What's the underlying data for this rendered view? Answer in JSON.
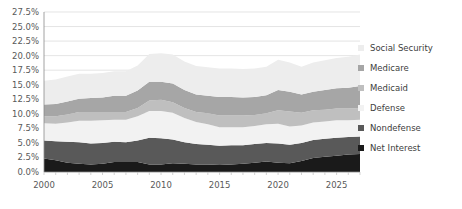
{
  "chart_data": {
    "type": "area",
    "stacked": true,
    "title": "",
    "subtitle": "",
    "xlabel": "",
    "ylabel": "",
    "grid": true,
    "legend_position": "right",
    "xlim": [
      2000,
      2027
    ],
    "ylim": [
      0,
      27.5
    ],
    "y_tick_labels": [
      "0.0%",
      "2.5%",
      "5.0%",
      "7.5%",
      "10.0%",
      "12.5%",
      "15.0%",
      "17.5%",
      "20.0%",
      "22.5%",
      "25.0%",
      "27.5%"
    ],
    "y_tick_values": [
      0,
      2.5,
      5,
      7.5,
      10,
      12.5,
      15,
      17.5,
      20,
      22.5,
      25,
      27.5
    ],
    "x_tick_labels": [
      "2000",
      "2005",
      "2010",
      "2015",
      "2020",
      "2025"
    ],
    "x_tick_values": [
      2000,
      2005,
      2010,
      2015,
      2020,
      2025
    ],
    "x": [
      2000,
      2001,
      2002,
      2003,
      2004,
      2005,
      2006,
      2007,
      2008,
      2009,
      2010,
      2011,
      2012,
      2013,
      2014,
      2015,
      2016,
      2017,
      2018,
      2019,
      2020,
      2021,
      2022,
      2023,
      2024,
      2025,
      2026,
      2027
    ],
    "stack_order_bottom_to_top": [
      "Net Interest",
      "Nondefense",
      "Defense",
      "Medicaid",
      "Medicare",
      "Social Security"
    ],
    "series": [
      {
        "name": "Net Interest",
        "color": "#1a1a1a",
        "values": [
          2.3,
          2.0,
          1.6,
          1.4,
          1.3,
          1.4,
          1.7,
          1.7,
          1.7,
          1.3,
          1.3,
          1.5,
          1.4,
          1.3,
          1.3,
          1.2,
          1.3,
          1.4,
          1.6,
          1.8,
          1.6,
          1.5,
          1.9,
          2.4,
          2.6,
          2.8,
          3.0,
          3.1
        ]
      },
      {
        "name": "Nondefense",
        "color": "#595959",
        "values": [
          3.1,
          3.3,
          3.6,
          3.7,
          3.6,
          3.6,
          3.5,
          3.4,
          3.7,
          4.6,
          4.5,
          4.1,
          3.7,
          3.5,
          3.4,
          3.3,
          3.3,
          3.2,
          3.2,
          3.2,
          3.3,
          3.2,
          3.1,
          3.1,
          3.1,
          3.1,
          3.0,
          3.0
        ]
      },
      {
        "name": "Defense",
        "color": "#f2f2f2",
        "values": [
          3.0,
          3.0,
          3.3,
          3.7,
          3.9,
          3.9,
          3.8,
          3.9,
          4.2,
          4.6,
          4.7,
          4.6,
          4.2,
          3.8,
          3.5,
          3.2,
          3.1,
          3.1,
          3.1,
          3.2,
          3.4,
          3.1,
          3.0,
          3.0,
          3.0,
          3.0,
          2.9,
          2.9
        ]
      },
      {
        "name": "Medicaid",
        "color": "#bfbfbf",
        "values": [
          1.2,
          1.3,
          1.4,
          1.5,
          1.5,
          1.4,
          1.3,
          1.3,
          1.4,
          1.8,
          1.9,
          1.8,
          1.7,
          1.7,
          1.9,
          2.0,
          2.0,
          2.0,
          1.9,
          1.9,
          2.3,
          2.6,
          2.2,
          2.1,
          2.0,
          2.0,
          2.0,
          2.0
        ]
      },
      {
        "name": "Medicare",
        "color": "#a6a6a6",
        "values": [
          2.0,
          2.1,
          2.2,
          2.3,
          2.4,
          2.5,
          2.8,
          2.8,
          3.0,
          3.2,
          3.1,
          3.2,
          3.1,
          3.0,
          3.0,
          3.2,
          3.2,
          3.1,
          3.1,
          3.1,
          3.5,
          3.4,
          3.1,
          3.2,
          3.4,
          3.5,
          3.6,
          3.8
        ]
      },
      {
        "name": "Social Security",
        "color": "#ededed",
        "values": [
          4.1,
          4.2,
          4.3,
          4.3,
          4.2,
          4.2,
          4.2,
          4.2,
          4.3,
          4.8,
          4.9,
          5.0,
          4.9,
          4.9,
          4.9,
          4.9,
          4.9,
          4.9,
          4.9,
          4.9,
          5.2,
          5.0,
          4.8,
          5.0,
          5.1,
          5.2,
          5.3,
          5.4
        ]
      }
    ]
  },
  "legend": {
    "items": [
      {
        "label": "Social Security",
        "color": "#ededed"
      },
      {
        "label": "Medicare",
        "color": "#a6a6a6"
      },
      {
        "label": "Medicaid",
        "color": "#bfbfbf"
      },
      {
        "label": "Defense",
        "color": "#f2f2f2"
      },
      {
        "label": "Nondefense",
        "color": "#595959"
      },
      {
        "label": "Net Interest",
        "color": "#1a1a1a"
      }
    ]
  }
}
